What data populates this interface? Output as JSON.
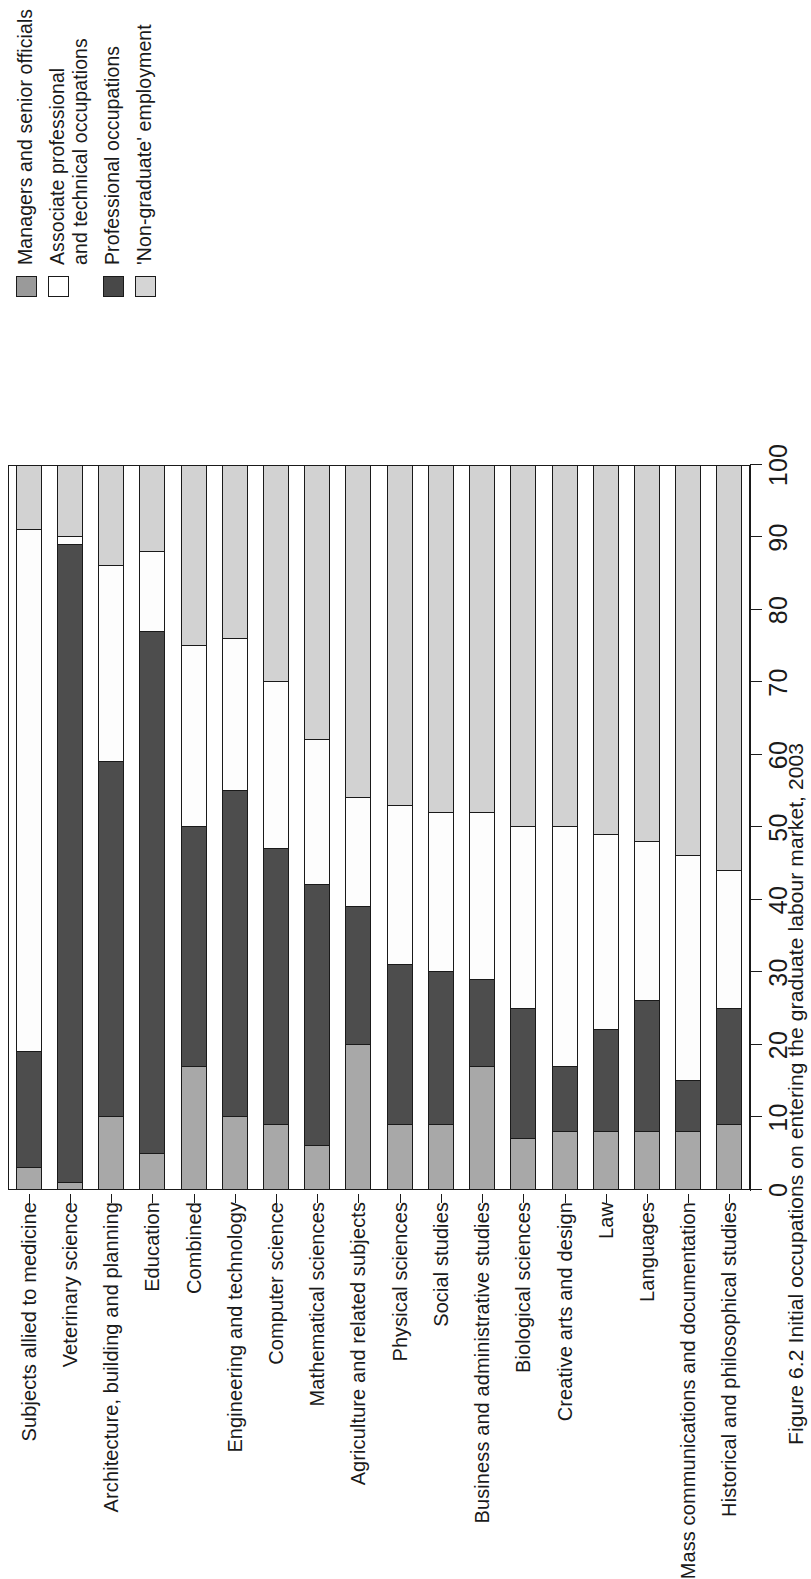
{
  "figure": {
    "caption": "Figure 6.2  Initial occupations on entering the graduate labour market, 2003"
  },
  "legend": {
    "position": "top-right",
    "items": [
      {
        "key": "managers",
        "label": "Managers and senior officials",
        "color": "#9a9a9a",
        "swatch": "legend-swatch-managers"
      },
      {
        "key": "associate",
        "label": "Associate professional\nand technical occupations",
        "color": "#ffffff",
        "swatch": "legend-swatch-associate"
      },
      {
        "key": "professional",
        "label": "Professional occupations",
        "color": "#484848",
        "swatch": "legend-swatch-professional"
      },
      {
        "key": "nongraduate",
        "label": "'Non-graduate' employment",
        "color": "#d5d5d5",
        "swatch": "legend-swatch-nongraduate"
      }
    ]
  },
  "axis": {
    "ticks": [
      "0",
      "10",
      "20",
      "30",
      "40",
      "50",
      "60",
      "70",
      "80",
      "90",
      "100"
    ],
    "min": 0,
    "max": 100
  },
  "chart_data": {
    "type": "bar",
    "orientation": "horizontal-stacked",
    "title": "",
    "subtitle": "",
    "xlabel": "",
    "ylabel": "",
    "xlim": [
      0,
      100
    ],
    "grid": false,
    "legend_position": "top-right",
    "stacked": true,
    "stack_order": [
      "Managers and senior officials",
      "Professional occupations",
      "Associate professional and technical occupations",
      "'Non-graduate' employment"
    ],
    "series_colors": [
      "#a8a8a8",
      "#4d4d4d",
      "#fdfdfd",
      "#d2d2d2"
    ],
    "categories": [
      "Subjects allied to medicine",
      "Veterinary science",
      "Architecture, building and planning",
      "Education",
      "Combined",
      "Engineering and technology",
      "Computer science",
      "Mathematical sciences",
      "Agriculture and related subjects",
      "Physical sciences",
      "Social studies",
      "Business and administrative studies",
      "Biological sciences",
      "Creative arts and design",
      "Law",
      "Languages",
      "Mass communications and documentation",
      "Historical and philosophical studies"
    ],
    "series": [
      {
        "name": "Managers and senior officials",
        "color": "#a8a8a8",
        "values": [
          3,
          1,
          10,
          5,
          17,
          10,
          9,
          6,
          20,
          9,
          9,
          17,
          7,
          8,
          8,
          8,
          8,
          9
        ]
      },
      {
        "name": "Professional occupations",
        "color": "#4d4d4d",
        "values": [
          16,
          88,
          49,
          72,
          33,
          45,
          38,
          36,
          19,
          22,
          21,
          12,
          18,
          9,
          14,
          18,
          7,
          16
        ]
      },
      {
        "name": "Associate professional and technical occupations",
        "color": "#fdfdfd",
        "values": [
          72,
          1,
          27,
          11,
          25,
          21,
          23,
          20,
          15,
          22,
          22,
          23,
          25,
          33,
          27,
          22,
          31,
          19
        ]
      },
      {
        "name": "'Non-graduate' employment",
        "color": "#d2d2d2",
        "values": [
          9,
          10,
          14,
          12,
          25,
          24,
          30,
          38,
          46,
          47,
          48,
          48,
          50,
          50,
          51,
          52,
          54,
          56
        ]
      }
    ]
  }
}
